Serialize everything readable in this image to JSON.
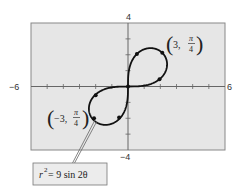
{
  "chart_data": {
    "type": "line",
    "title": "",
    "equation": "r^2 = 9 sin 2θ",
    "curve": "lemniscate",
    "xlim": [
      -6,
      6
    ],
    "ylim": [
      -4,
      4
    ],
    "grid": false,
    "x_tick_labels": [
      "-6",
      "6"
    ],
    "y_tick_labels": [
      "4",
      "-4"
    ],
    "x_ticks_step": 1,
    "y_ticks_step": 1,
    "annotations": [
      {
        "label": "(3, π/4)",
        "r": 3,
        "theta": "π/4"
      },
      {
        "label": "(-3, π/4)",
        "r": -3,
        "theta": "π/4"
      }
    ],
    "marked_points": [
      [
        0.55,
        2.05
      ],
      [
        2.12,
        2.12
      ],
      [
        1.95,
        0.45
      ],
      [
        -2.0,
        -0.55
      ],
      [
        -2.1,
        -2.0
      ],
      [
        -0.55,
        -1.95
      ]
    ],
    "legend_box": "r² = 9 sin 2θ"
  },
  "labels": {
    "x_min": "−6",
    "x_max": "6",
    "y_max": "4",
    "y_min": "−4",
    "point_a_r": "3,",
    "point_a_num": "π",
    "point_a_den": "4",
    "point_b_r": "−3,",
    "point_b_num": "π",
    "point_b_den": "4",
    "eq_r": "r",
    "eq_exp": "2",
    "eq_rest": " = 9 sin 2θ"
  },
  "colors": {
    "plot_bg": "#e6e6e6",
    "frame": "#888888",
    "curve": "#111111",
    "box_bg": "#ececec"
  }
}
